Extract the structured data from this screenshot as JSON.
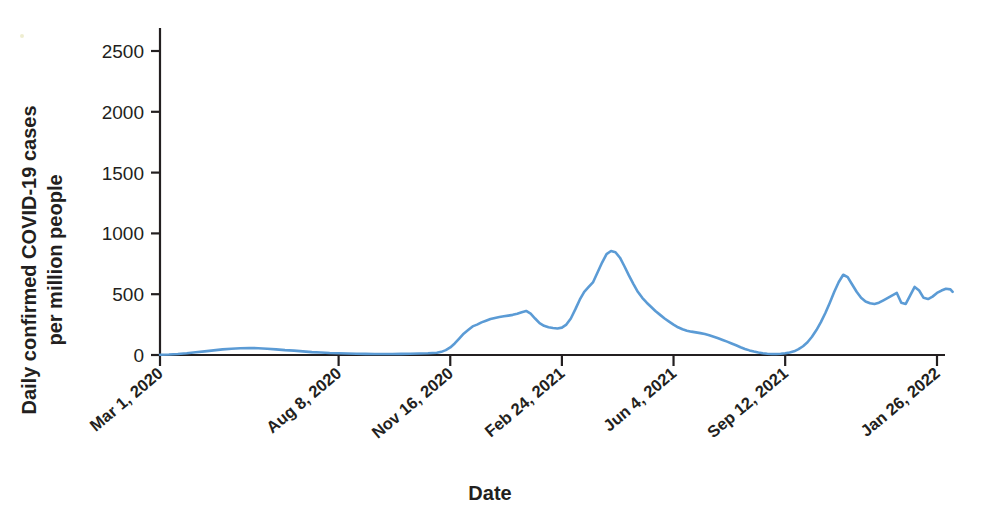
{
  "chart_data": {
    "type": "line",
    "title": "",
    "xlabel": "Date",
    "ylabel": "Daily confirmed COVID-19 cases per million people",
    "ylabel_line1": "Daily confirmed COVID-19 cases",
    "ylabel_line2": "per million people",
    "ylim": [
      0,
      2700
    ],
    "yticks": [
      0,
      500,
      1000,
      1500,
      2000,
      2500
    ],
    "ytick_labels": [
      "0",
      "500",
      "1000",
      "1500",
      "2000",
      "2500"
    ],
    "xtick_labels": [
      "Mar 1, 2020",
      "Aug 8, 2020",
      "Nov 16, 2020",
      "Feb 24, 2021",
      "Jun 4, 2021",
      "Sep 12, 2021",
      "Jan 26, 2022"
    ],
    "xtick_days": [
      0,
      160,
      260,
      360,
      460,
      560,
      696
    ],
    "xlim_days": [
      0,
      710
    ],
    "grid": false,
    "legend": false,
    "line_color": "#5b9bd5",
    "axis_color": "#231f20",
    "series": [
      {
        "name": "Daily confirmed COVID-19 cases per million people",
        "x_days": [
          0,
          8,
          16,
          24,
          32,
          40,
          48,
          56,
          64,
          72,
          80,
          88,
          96,
          104,
          112,
          120,
          128,
          136,
          144,
          152,
          160,
          168,
          176,
          184,
          192,
          200,
          208,
          216,
          224,
          232,
          240,
          248,
          252,
          256,
          260,
          264,
          268,
          272,
          276,
          280,
          284,
          288,
          292,
          296,
          300,
          304,
          308,
          312,
          316,
          320,
          324,
          328,
          332,
          336,
          340,
          344,
          348,
          352,
          356,
          360,
          364,
          368,
          372,
          376,
          380,
          384,
          388,
          392,
          396,
          400,
          404,
          408,
          412,
          416,
          420,
          424,
          428,
          432,
          436,
          440,
          444,
          448,
          452,
          456,
          460,
          464,
          468,
          472,
          476,
          480,
          484,
          488,
          492,
          496,
          500,
          504,
          508,
          512,
          516,
          520,
          524,
          528,
          532,
          536,
          540,
          544,
          548,
          552,
          556,
          560,
          564,
          568,
          572,
          576,
          580,
          584,
          588,
          592,
          596,
          600,
          604,
          608,
          612,
          616,
          620,
          624,
          628,
          632,
          636,
          640,
          644,
          648,
          652,
          656,
          660,
          664,
          668,
          672,
          676,
          680,
          684,
          688,
          692,
          696,
          700,
          704,
          708,
          710
        ],
        "y_values": [
          2,
          4,
          8,
          14,
          22,
          30,
          38,
          46,
          52,
          56,
          58,
          56,
          52,
          46,
          40,
          36,
          30,
          24,
          20,
          16,
          14,
          12,
          10,
          9,
          8,
          8,
          8,
          9,
          10,
          12,
          14,
          18,
          26,
          40,
          62,
          95,
          135,
          175,
          205,
          235,
          250,
          268,
          282,
          296,
          305,
          312,
          318,
          324,
          330,
          340,
          352,
          362,
          340,
          300,
          262,
          240,
          228,
          222,
          218,
          225,
          250,
          300,
          375,
          455,
          520,
          560,
          600,
          680,
          760,
          830,
          855,
          845,
          800,
          730,
          655,
          585,
          520,
          470,
          430,
          395,
          360,
          330,
          300,
          275,
          250,
          228,
          212,
          200,
          192,
          186,
          180,
          172,
          162,
          150,
          138,
          124,
          110,
          95,
          80,
          64,
          50,
          38,
          28,
          20,
          14,
          10,
          8,
          8,
          10,
          14,
          20,
          30,
          48,
          72,
          105,
          150,
          205,
          270,
          345,
          430,
          520,
          600,
          660,
          640,
          580,
          520,
          470,
          440,
          425,
          420,
          430,
          450,
          470,
          490,
          510,
          430,
          420,
          490,
          560,
          530,
          470,
          460,
          480,
          510,
          530,
          545,
          540,
          520,
          505,
          520,
          560,
          610,
          650,
          640,
          600,
          560,
          530,
          515,
          510,
          520,
          545,
          580,
          620,
          660,
          690,
          700,
          690,
          680,
          690,
          720,
          790,
          900,
          1050,
          1250,
          1480,
          1700,
          1880,
          1980,
          2050,
          2150,
          2380,
          2560,
          2620,
          2600,
          2520,
          2330,
          2050,
          1750,
          1520,
          1380,
          1315,
          1310,
          1312
        ]
      }
    ]
  }
}
